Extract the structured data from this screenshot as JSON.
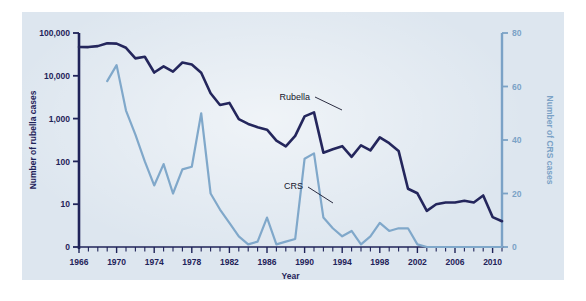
{
  "figure": {
    "name": "rubella-crs-incidence-chart",
    "background_color": "#dde6ef",
    "plate_color": "#dde6ef"
  },
  "chart_data": {
    "type": "line",
    "title": "",
    "subtitle": "",
    "xlabel": "Year",
    "ylabel": "Number of rubella cases",
    "ylabel_secondary": "Number of CRS cases",
    "grid": false,
    "legend_position": "inline-annotations",
    "x_axis": {
      "label": "Year",
      "tick_labels": [
        "1966",
        "1970",
        "1974",
        "1978",
        "1982",
        "1986",
        "1990",
        "1994",
        "1998",
        "2002",
        "2006",
        "2010"
      ],
      "tick_values": [
        1966,
        1970,
        1974,
        1978,
        1982,
        1986,
        1990,
        1994,
        1998,
        2002,
        2006,
        2010
      ],
      "minor_tick_interval": 1,
      "range": [
        1966,
        2011
      ]
    },
    "y_axis_left": {
      "label": "Number of rubella cases",
      "scale": "log",
      "tick_labels": [
        "0",
        "10",
        "100",
        "1,000",
        "10,000",
        "100,000"
      ],
      "tick_values": [
        0,
        10,
        100,
        1000,
        10000,
        100000
      ],
      "range": [
        0,
        100000
      ],
      "color": "#1f2359"
    },
    "y_axis_right": {
      "label": "Number of CRS cases",
      "scale": "linear",
      "tick_labels": [
        "0",
        "20",
        "40",
        "60",
        "80"
      ],
      "tick_values": [
        0,
        20,
        40,
        60,
        80
      ],
      "range": [
        0,
        80
      ],
      "color": "#7ba2c6"
    },
    "series": [
      {
        "name": "Rubella",
        "axis": "left",
        "color": "#24265c",
        "line_width": 2.6,
        "annotation_label": "Rubella",
        "x": [
          1966,
          1967,
          1968,
          1969,
          1970,
          1971,
          1972,
          1973,
          1974,
          1975,
          1976,
          1977,
          1978,
          1979,
          1980,
          1981,
          1982,
          1983,
          1984,
          1985,
          1986,
          1987,
          1988,
          1989,
          1990,
          1991,
          1992,
          1993,
          1994,
          1995,
          1996,
          1997,
          1998,
          1999,
          2000,
          2001,
          2002,
          2003,
          2004,
          2005,
          2006,
          2007,
          2008,
          2009,
          2010,
          2011
        ],
        "values": [
          46975,
          46888,
          49371,
          57686,
          56552,
          45086,
          25507,
          27804,
          11917,
          16652,
          12491,
          20395,
          18269,
          11795,
          3904,
          2077,
          2325,
          970,
          752,
          630,
          551,
          306,
          225,
          396,
          1125,
          1401,
          160,
          192,
          227,
          128,
          238,
          181,
          364,
          267,
          176,
          23,
          18,
          7,
          10,
          11,
          11,
          12,
          11,
          16,
          5,
          4
        ]
      },
      {
        "name": "CRS",
        "axis": "right",
        "color": "#80a8ca",
        "line_width": 2.2,
        "annotation_label": "CRS",
        "x": [
          1969,
          1970,
          1971,
          1972,
          1973,
          1974,
          1975,
          1976,
          1977,
          1978,
          1979,
          1980,
          1981,
          1982,
          1983,
          1984,
          1985,
          1986,
          1987,
          1988,
          1989,
          1990,
          1991,
          1992,
          1993,
          1994,
          1995,
          1996,
          1997,
          1998,
          1999,
          2000,
          2001,
          2002,
          2003,
          2004,
          2005,
          2006,
          2007,
          2008,
          2009,
          2010,
          2011
        ],
        "values": [
          62,
          68,
          51,
          42,
          32,
          23,
          31,
          20,
          29,
          30,
          50,
          20,
          14,
          9,
          4,
          1,
          2,
          11,
          1,
          2,
          3,
          33,
          35,
          11,
          7,
          4,
          6,
          1,
          4,
          9,
          6,
          7,
          7,
          1,
          0,
          0,
          0,
          0,
          0,
          0,
          0,
          0,
          0
        ]
      }
    ],
    "annotations": [
      {
        "text": "Rubella",
        "series": "Rubella",
        "x_anchor": 1988.0,
        "leader": true
      },
      {
        "text": "CRS",
        "series": "CRS",
        "x_anchor": 1987.5,
        "leader": true
      }
    ]
  }
}
